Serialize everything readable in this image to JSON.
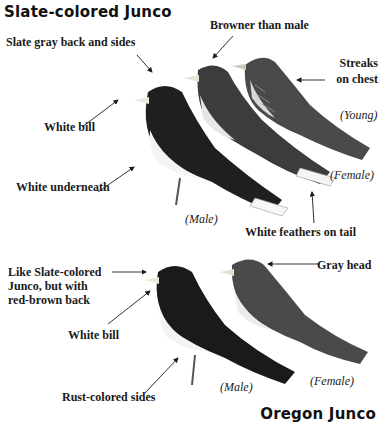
{
  "sections": [
    {
      "title": "Slate-colored Junco",
      "labels": {
        "back_sides": "Slate gray back and sides",
        "browner": "Browner than male",
        "streaks_line1": "Streaks",
        "streaks_line2": "on chest",
        "young": "(Young)",
        "white_bill": "White bill",
        "white_underneath": "White underneath",
        "female": "(Female)",
        "male": "(Male)",
        "tail": "White feathers on tail"
      }
    },
    {
      "title": "Oregon Junco",
      "labels": {
        "like_line1": "Like Slate-colored",
        "like_line2": "Junco, but with",
        "like_line3": "red-brown back",
        "gray_head": "Gray head",
        "white_bill": "White bill",
        "rust_sides": "Rust-colored sides",
        "male": "(Male)",
        "female": "(Female)"
      }
    }
  ],
  "colors": {
    "ink": "#1a1a1a",
    "slate": "#2b2b2b",
    "belly": "#f2f2f2",
    "streak": "#6b6b6b"
  }
}
